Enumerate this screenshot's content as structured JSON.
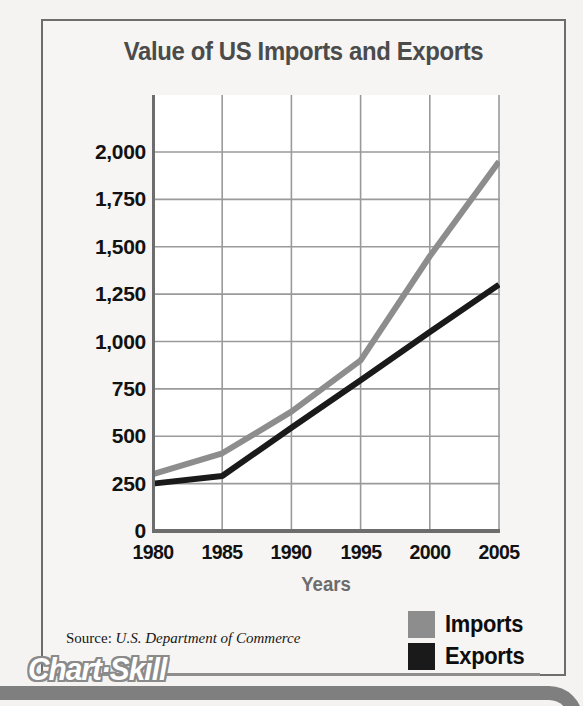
{
  "figure": {
    "title": "Value of US Imports and Exports",
    "source_label": "Source:",
    "source_org": "U.S. Department of Commerce",
    "banner_text": "Chart·Skill"
  },
  "legend": {
    "position": "bottom-right",
    "entries": [
      {
        "label": "Imports",
        "color": "#8d8d8d"
      },
      {
        "label": "Exports",
        "color": "#1a1a1a"
      }
    ]
  },
  "colors": {
    "imports": "#8d8d8d",
    "exports": "#1a1a1a",
    "grid": "#9a9a9a",
    "axis": "#6d6d6d",
    "title": "#4b4b4b",
    "axis_title": "#6c6c6c",
    "tick_label": "#121212",
    "plot_background": "#ffffff",
    "page_background": "#f4f3f1",
    "banner": "#7f7f7f"
  },
  "chart_data": {
    "type": "line",
    "title": "Value of US Imports and Exports",
    "subtitle": "",
    "xlabel": "Years",
    "ylabel": "",
    "x": [
      1980,
      1985,
      1990,
      1995,
      2000,
      2005
    ],
    "categories": [
      "1980",
      "1985",
      "1990",
      "1995",
      "2000",
      "2005"
    ],
    "series": [
      {
        "name": "Imports",
        "color": "#8d8d8d",
        "values": [
          300,
          410,
          630,
          900,
          1450,
          1950
        ]
      },
      {
        "name": "Exports",
        "color": "#1a1a1a",
        "values": [
          250,
          290,
          545,
          795,
          1050,
          1300
        ]
      }
    ],
    "xlim": [
      1980,
      2005
    ],
    "ylim": [
      0,
      2000
    ],
    "yticks": [
      0,
      250,
      500,
      750,
      1000,
      1250,
      1500,
      1750,
      2000
    ],
    "ytick_labels": [
      "0",
      "250",
      "500",
      "750",
      "1,000",
      "1,250",
      "1,500",
      "1,750",
      "2,000"
    ],
    "xticks": [
      1980,
      1985,
      1990,
      1995,
      2000,
      2005
    ],
    "xtick_labels": [
      "1980",
      "1985",
      "1990",
      "1995",
      "2000",
      "2005"
    ],
    "grid": true,
    "legend": true,
    "legend_position": "bottom-right",
    "source": "Source: U.S. Department of Commerce",
    "units_note": ""
  }
}
